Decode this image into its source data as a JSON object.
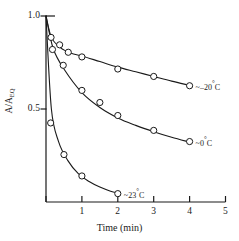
{
  "chart_data": {
    "type": "line",
    "title": "",
    "xlabel": "Time (min)",
    "ylabel": "A/A_EQ",
    "ylabel_main": "A/A",
    "ylabel_sub": "EQ",
    "xlim": [
      0,
      5
    ],
    "ylim": [
      0,
      1.0
    ],
    "xticks": [
      1,
      2,
      3,
      4,
      5
    ],
    "xtick_labels": [
      "1",
      "2",
      "3",
      "4",
      "5"
    ],
    "yticks": [
      0.5,
      1.0
    ],
    "ytick_labels": [
      "0.5",
      "1.0"
    ],
    "grid": false,
    "legend_position": "inline-right-of-curve",
    "marker": "open-circle",
    "series": [
      {
        "name": "~-20°C",
        "label": "~–20°C",
        "label_prefix": "~–20",
        "label_unit": "C",
        "points": [
          {
            "x": 0.14,
            "y": 0.885
          },
          {
            "x": 0.38,
            "y": 0.845
          },
          {
            "x": 0.62,
            "y": 0.805
          },
          {
            "x": 1.0,
            "y": 0.78
          },
          {
            "x": 2.0,
            "y": 0.715
          },
          {
            "x": 3.0,
            "y": 0.675
          },
          {
            "x": 4.0,
            "y": 0.625
          }
        ],
        "curve": [
          {
            "x": 0.0,
            "y": 1.0
          },
          {
            "x": 0.15,
            "y": 0.885
          },
          {
            "x": 0.4,
            "y": 0.83
          },
          {
            "x": 0.7,
            "y": 0.8
          },
          {
            "x": 1.0,
            "y": 0.785
          },
          {
            "x": 1.5,
            "y": 0.755
          },
          {
            "x": 2.0,
            "y": 0.725
          },
          {
            "x": 2.5,
            "y": 0.7
          },
          {
            "x": 3.0,
            "y": 0.675
          },
          {
            "x": 3.5,
            "y": 0.65
          },
          {
            "x": 4.0,
            "y": 0.627
          }
        ]
      },
      {
        "name": "~0°C",
        "label": "~0°C",
        "label_prefix": "~0",
        "label_unit": "C",
        "points": [
          {
            "x": 0.18,
            "y": 0.82
          },
          {
            "x": 0.48,
            "y": 0.735
          },
          {
            "x": 1.0,
            "y": 0.6
          },
          {
            "x": 1.5,
            "y": 0.535
          },
          {
            "x": 2.0,
            "y": 0.465
          },
          {
            "x": 3.0,
            "y": 0.385
          },
          {
            "x": 4.0,
            "y": 0.325
          }
        ],
        "curve": [
          {
            "x": 0.0,
            "y": 1.0
          },
          {
            "x": 0.2,
            "y": 0.825
          },
          {
            "x": 0.5,
            "y": 0.715
          },
          {
            "x": 1.0,
            "y": 0.588
          },
          {
            "x": 1.5,
            "y": 0.508
          },
          {
            "x": 2.0,
            "y": 0.452
          },
          {
            "x": 2.5,
            "y": 0.412
          },
          {
            "x": 3.0,
            "y": 0.378
          },
          {
            "x": 3.5,
            "y": 0.348
          },
          {
            "x": 4.0,
            "y": 0.322
          }
        ]
      },
      {
        "name": "~23°C",
        "label": "~23°C",
        "label_prefix": "~23",
        "label_unit": "C",
        "points": [
          {
            "x": 0.13,
            "y": 0.425
          },
          {
            "x": 0.5,
            "y": 0.255
          },
          {
            "x": 1.0,
            "y": 0.14
          },
          {
            "x": 2.0,
            "y": 0.045
          }
        ],
        "curve": [
          {
            "x": 0.0,
            "y": 1.0
          },
          {
            "x": 0.15,
            "y": 0.5
          },
          {
            "x": 0.35,
            "y": 0.325
          },
          {
            "x": 0.6,
            "y": 0.225
          },
          {
            "x": 0.9,
            "y": 0.152
          },
          {
            "x": 1.2,
            "y": 0.11
          },
          {
            "x": 1.5,
            "y": 0.08
          },
          {
            "x": 1.8,
            "y": 0.058
          },
          {
            "x": 2.0,
            "y": 0.048
          }
        ]
      }
    ]
  },
  "axis": {
    "y_top_label": "1.0",
    "y_mid_label": "0.5",
    "x_axis_title": "Time (min)"
  },
  "colors": {
    "axis": "#1a1a1a",
    "curve": "#1a1a1a",
    "marker_fill": "#ffffff",
    "background": "#ffffff"
  }
}
